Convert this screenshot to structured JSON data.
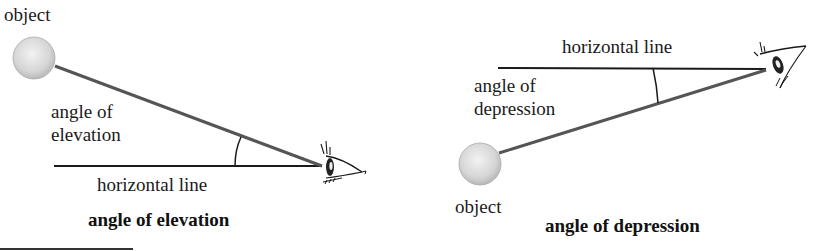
{
  "left_panel": {
    "object_label": "object",
    "angle_label_line1": "angle of",
    "angle_label_line2": "elevation",
    "horizontal_label": "horizontal line",
    "caption": "angle of elevation"
  },
  "right_panel": {
    "object_label": "object",
    "angle_label_line1": "angle of",
    "angle_label_line2": "depression",
    "horizontal_label": "horizontal line",
    "caption": "angle of depression"
  },
  "colors": {
    "sight_line": "#555555",
    "horizontal_line": "#1a1a1a",
    "object_fill": "#d9d9d9",
    "text": "#1a1a1a"
  }
}
